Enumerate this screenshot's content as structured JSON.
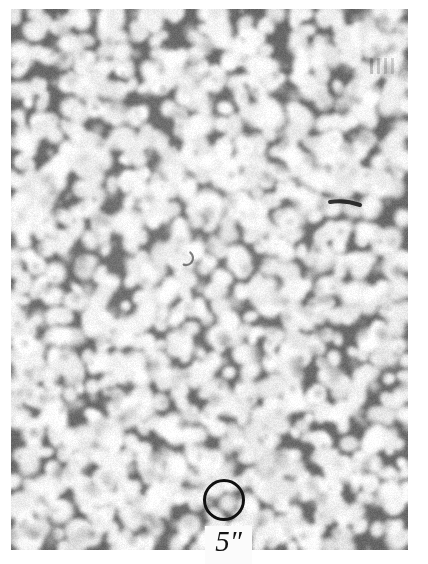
{
  "figure": {
    "kind": "solar-granulation-photograph"
  },
  "scale_marker": {
    "label": "5″",
    "shape": "circle",
    "diameter_px": 42,
    "center_x_px": 224,
    "center_y_px": 500,
    "stroke_color": "#111111",
    "stroke_width_px": 3,
    "label_box_color": "#fbfbfb"
  },
  "plate": {
    "background_color": "#ffffff",
    "image_left_px": 11,
    "image_top_px": 9,
    "image_width_px": 397,
    "image_height_px": 541,
    "mean_tone_color": "#b9b9b9",
    "granule_bright_color": "#f0f0f0",
    "lane_dark_color": "#6e6e6e"
  },
  "texture": {
    "type": "granulation",
    "cell_diameter_px_min": 14,
    "cell_diameter_px_max": 26,
    "cell_count": 1450,
    "seed": 20240517,
    "blur_px": 1.6,
    "contrast": 1.18
  },
  "features": [
    {
      "name": "pore-cluster",
      "x": 171,
      "y": 245,
      "w": 13,
      "h": 16,
      "darkness": 0.86,
      "shape": "blob"
    },
    {
      "name": "pore-tail",
      "x": 186,
      "y": 258,
      "w": 14,
      "h": 9,
      "darkness": 0.62,
      "shape": "arc"
    },
    {
      "name": "dark-streak",
      "x": 345,
      "y": 203,
      "w": 30,
      "h": 4,
      "darkness": 0.88,
      "shape": "streak"
    },
    {
      "name": "pore-a",
      "x": 347,
      "y": 434,
      "w": 7,
      "h": 7,
      "darkness": 0.82,
      "shape": "blob"
    },
    {
      "name": "pore-b",
      "x": 344,
      "y": 447,
      "w": 6,
      "h": 6,
      "darkness": 0.74,
      "shape": "blob"
    },
    {
      "name": "speck-tl",
      "x": 24,
      "y": 61,
      "w": 8,
      "h": 6,
      "darkness": 0.7,
      "shape": "blob"
    },
    {
      "name": "speck-tr",
      "x": 372,
      "y": 53,
      "w": 5,
      "h": 5,
      "darkness": 0.8,
      "shape": "blob"
    },
    {
      "name": "speck-tm",
      "x": 262,
      "y": 40,
      "w": 4,
      "h": 4,
      "darkness": 0.72,
      "shape": "blob"
    },
    {
      "name": "speck-tm2",
      "x": 279,
      "y": 51,
      "w": 4,
      "h": 4,
      "darkness": 0.66,
      "shape": "blob"
    },
    {
      "name": "speck-ml",
      "x": 145,
      "y": 60,
      "w": 6,
      "h": 4,
      "darkness": 0.62,
      "shape": "blob"
    },
    {
      "name": "speck-mm",
      "x": 209,
      "y": 125,
      "w": 4,
      "h": 4,
      "darkness": 0.58,
      "shape": "blob"
    },
    {
      "name": "speck-mr",
      "x": 304,
      "y": 152,
      "w": 5,
      "h": 4,
      "darkness": 0.6,
      "shape": "blob"
    },
    {
      "name": "speck-c",
      "x": 160,
      "y": 322,
      "w": 4,
      "h": 4,
      "darkness": 0.6,
      "shape": "blob"
    },
    {
      "name": "speck-cl",
      "x": 112,
      "y": 186,
      "w": 4,
      "h": 4,
      "darkness": 0.55,
      "shape": "blob"
    },
    {
      "name": "speck-br",
      "x": 357,
      "y": 466,
      "w": 5,
      "h": 5,
      "darkness": 0.74,
      "shape": "blob"
    },
    {
      "name": "speck-bm",
      "x": 246,
      "y": 471,
      "w": 4,
      "h": 4,
      "darkness": 0.62,
      "shape": "blob"
    },
    {
      "name": "speck-bl",
      "x": 69,
      "y": 404,
      "w": 4,
      "h": 4,
      "darkness": 0.56,
      "shape": "blob"
    },
    {
      "name": "speck-rr",
      "x": 389,
      "y": 523,
      "w": 4,
      "h": 4,
      "darkness": 0.66,
      "shape": "blob"
    }
  ],
  "plate_marks": [
    {
      "name": "tick-1",
      "x": 370,
      "y": 58,
      "w": 3,
      "h": 16,
      "darkness": 0.24
    },
    {
      "name": "tick-2",
      "x": 377,
      "y": 58,
      "w": 3,
      "h": 16,
      "darkness": 0.22
    },
    {
      "name": "tick-3",
      "x": 384,
      "y": 58,
      "w": 3,
      "h": 16,
      "darkness": 0.2
    },
    {
      "name": "tick-4",
      "x": 391,
      "y": 58,
      "w": 3,
      "h": 16,
      "darkness": 0.18
    }
  ]
}
